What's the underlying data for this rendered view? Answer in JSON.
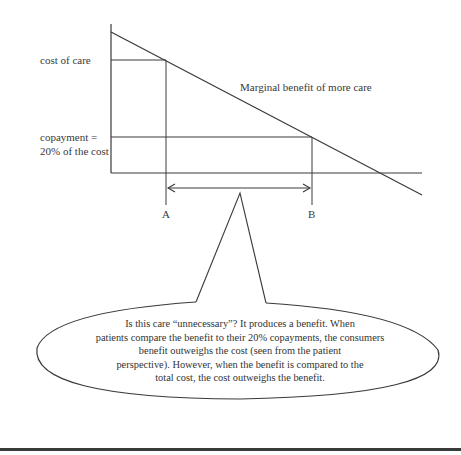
{
  "diagram": {
    "y_axis_labels": {
      "cost_of_care": "cost of care",
      "copayment_line1": "copayment =",
      "copayment_line2": "20% of the cost"
    },
    "curve_label": "Marginal benefit of more care",
    "x_markers": {
      "a": "A",
      "b": "B"
    },
    "callout": {
      "lines": [
        "Is this care “unnecessary”?  It produces a benefit.  When",
        "patients compare the benefit to their 20% copayments, the consumers",
        "benefit outweighs the cost (seen from the patient",
        "perspective).  However, when the benefit is compared to the",
        "total cost, the cost outweighs the benefit."
      ]
    },
    "colors": {
      "line": "#3a3a3a",
      "text": "#3a3a3a",
      "rule": "#3a3a3a"
    }
  }
}
